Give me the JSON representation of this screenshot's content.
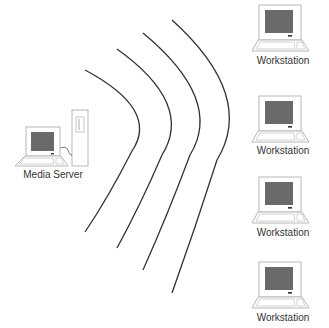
{
  "diagram": {
    "type": "network",
    "server": {
      "label": "Media Server",
      "icon": "media-server-icon"
    },
    "workstations": [
      {
        "label": "Workstation",
        "icon": "workstation-icon"
      },
      {
        "label": "Workstation",
        "icon": "workstation-icon"
      },
      {
        "label": "Workstation",
        "icon": "workstation-icon"
      },
      {
        "label": "Workstation",
        "icon": "workstation-icon"
      }
    ],
    "signal": {
      "icon": "wireless-waves-icon",
      "arc_count": 4
    },
    "colors": {
      "line": "#333333",
      "outline": "#b8b8b8",
      "screen": "#6a6a6a",
      "text": "#333333"
    }
  }
}
